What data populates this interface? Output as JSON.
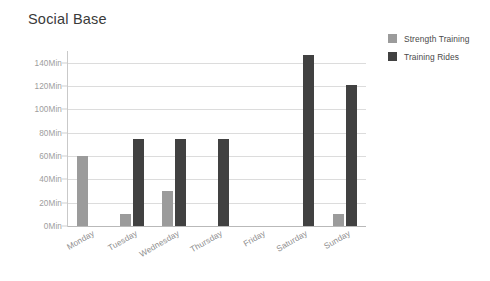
{
  "chart_data": {
    "type": "bar",
    "title": "Social Base",
    "xlabel": "",
    "ylabel": "",
    "ylim": [
      0,
      150
    ],
    "grid": true,
    "legend_position": "right",
    "categories": [
      "Monday",
      "Tuesday",
      "Wednesday",
      "Thursday",
      "Friday",
      "Saturday",
      "Sunday"
    ],
    "y_ticks": [
      0,
      20,
      40,
      60,
      80,
      100,
      120,
      140
    ],
    "y_tick_labels": [
      "0Min",
      "20Min",
      "40Min",
      "60Min",
      "80Min",
      "100Min",
      "120Min",
      "140Min"
    ],
    "y_unit": "Min",
    "series": [
      {
        "name": "Strength Training",
        "color": "#9b9b9b",
        "values": [
          60,
          10,
          30,
          0,
          0,
          0,
          10
        ]
      },
      {
        "name": "Training Rides",
        "color": "#414141",
        "values": [
          0,
          75,
          75,
          75,
          0,
          147,
          121
        ]
      }
    ]
  },
  "legend": {
    "items": [
      {
        "label": "Strength Training",
        "swatch": "strength"
      },
      {
        "label": "Training Rides",
        "swatch": "rides"
      }
    ]
  },
  "colors": {
    "strength_training": "#9b9b9b",
    "training_rides": "#414141",
    "gridline": "#dcdcdc",
    "axis": "#c9c9c9",
    "tick_text": "#9d9d9d",
    "title_text": "#3a3a3a",
    "background": "#ffffff"
  }
}
